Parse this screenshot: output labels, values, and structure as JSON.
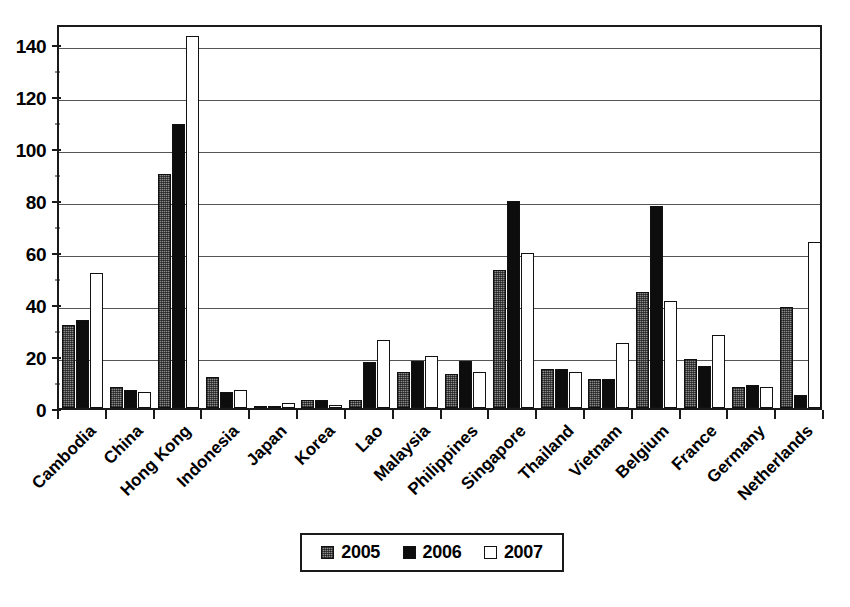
{
  "chart_data": {
    "type": "bar",
    "title": "",
    "subtitle": "",
    "xlabel": "",
    "ylabel": "",
    "ylim": [
      0,
      148
    ],
    "yticks": [
      0,
      20,
      40,
      60,
      80,
      100,
      120,
      140
    ],
    "ytick_labels": [
      "0",
      "20",
      "40",
      "60",
      "80",
      "100",
      "120",
      "140"
    ],
    "grid": true,
    "grid_axis": "y",
    "legend_position": "bottom-center",
    "orientation": "vertical",
    "categories": [
      "Cambodia",
      "China",
      "Hong Kong",
      "Indonesia",
      "Japan",
      "Korea",
      "Lao",
      "Malaysia",
      "Philippines",
      "Singapore",
      "Thailand",
      "Vietnam",
      "Belgium",
      "France",
      "Germany",
      "Netherlands"
    ],
    "series": [
      {
        "name": "2005",
        "fill": "gray-dotted",
        "color": "#8c8c8c",
        "values": [
          32,
          8,
          90,
          12,
          0.3,
          3,
          3,
          14,
          13,
          53,
          15,
          11,
          44.5,
          19,
          8,
          39
        ]
      },
      {
        "name": "2006",
        "fill": "black",
        "color": "#0d0d0d",
        "values": [
          34,
          7,
          109,
          6,
          0.3,
          3,
          17.5,
          18,
          18,
          79.5,
          15,
          11,
          77.5,
          16,
          9,
          5
        ]
      },
      {
        "name": "2007",
        "fill": "white",
        "color": "#ffffff",
        "values": [
          52,
          6,
          143,
          7,
          2,
          1,
          26,
          20,
          14,
          59.5,
          14,
          25,
          41,
          28,
          8,
          64
        ]
      }
    ]
  },
  "legend": {
    "entries": [
      {
        "label": "2005"
      },
      {
        "label": "2006"
      },
      {
        "label": "2007"
      }
    ]
  },
  "colors": {
    "axis": "#1a1a1a",
    "grid": "#555555",
    "background": "#ffffff",
    "series_2005": "#8c8c8c",
    "series_2006": "#0d0d0d",
    "series_2007": "#ffffff"
  }
}
